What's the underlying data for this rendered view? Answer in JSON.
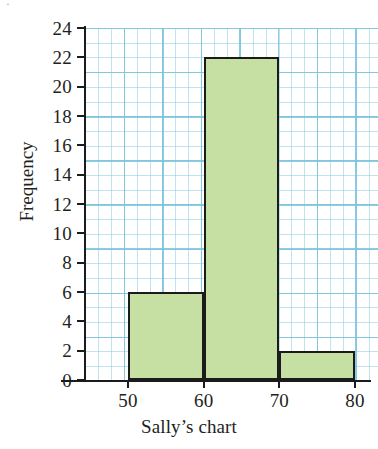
{
  "chart_data": {
    "type": "bar",
    "title": "",
    "subtitle": "",
    "xlabel": "Sally’s chart",
    "ylabel": "Frequency",
    "categories": [
      "50–60",
      "60–70",
      "70–80"
    ],
    "values": [
      6,
      22,
      2
    ],
    "bin_edges": [
      50,
      60,
      70,
      80
    ],
    "xlim": [
      45,
      82
    ],
    "ylim": [
      0,
      24
    ],
    "x_ticks": [
      50,
      60,
      70,
      80
    ],
    "x_tick_labels": [
      "50",
      "60",
      "70",
      "80"
    ],
    "y_ticks": [
      0,
      2,
      4,
      6,
      8,
      10,
      12,
      14,
      16,
      18,
      20,
      22,
      24
    ],
    "y_tick_labels": [
      "0",
      "2",
      "4",
      "6",
      "8",
      "10",
      "12",
      "14",
      "16",
      "18",
      "20",
      "22",
      "24"
    ],
    "grid": true,
    "grid_style": "graph-paper",
    "legend": "none",
    "bar_fill_color": "#c6e0a3",
    "bar_edge_color": "#1b1b1b",
    "grid_color": "#8ccde1",
    "axis_color": "#1b1b1b",
    "background_color": "#ffffff",
    "bars": [
      {
        "label": "50–60",
        "start": 50,
        "end": 60,
        "value": 6
      },
      {
        "label": "60–70",
        "start": 60,
        "end": 70,
        "value": 22
      },
      {
        "label": "70–80",
        "start": 70,
        "end": 80,
        "value": 2
      }
    ]
  },
  "artifact": {
    "glyph": "ᐧ"
  }
}
